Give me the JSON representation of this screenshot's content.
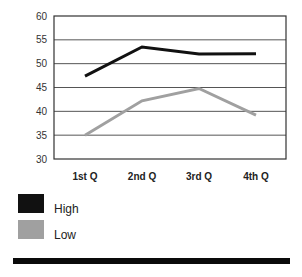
{
  "chart_data": {
    "type": "line",
    "title": "",
    "xlabel": "",
    "ylabel": "",
    "categories": [
      "1st Q",
      "2nd Q",
      "3rd Q",
      "4th Q"
    ],
    "series": [
      {
        "name": "High",
        "color": "#111111",
        "values": [
          47.4,
          53.5,
          52.0,
          52.1
        ]
      },
      {
        "name": "Low",
        "color": "#a0a0a0",
        "values": [
          35.0,
          42.2,
          44.8,
          39.2
        ]
      }
    ],
    "ylim": [
      30,
      60
    ],
    "yticks": [
      60,
      55,
      50,
      45,
      40,
      35,
      30
    ],
    "grid": true,
    "legend_position": "bottom-left"
  },
  "legend": {
    "items": [
      {
        "label": "High",
        "color": "#111111"
      },
      {
        "label": "Low",
        "color": "#a0a0a0"
      }
    ]
  }
}
